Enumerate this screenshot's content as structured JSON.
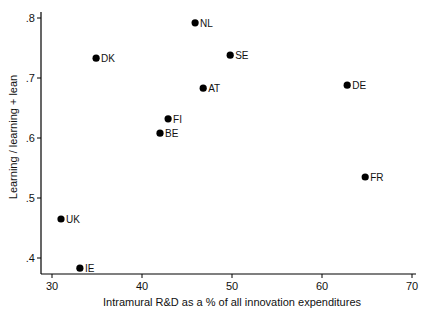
{
  "chart_data": {
    "type": "scatter",
    "title": "",
    "xlabel": "Intramural R&D as a % of all innovation expenditures",
    "ylabel": "Learning / learning + lean",
    "xlim": [
      29.5,
      71
    ],
    "ylim": [
      0.373,
      0.81
    ],
    "xticks": [
      30,
      40,
      50,
      60,
      70
    ],
    "xtick_labels": [
      "30",
      "40",
      "50",
      "60",
      "70"
    ],
    "yticks": [
      0.4,
      0.5,
      0.6,
      0.7,
      0.8
    ],
    "ytick_labels": [
      ".4",
      ".5",
      ".6",
      ".7",
      ".8"
    ],
    "grid": false,
    "legend": null,
    "points": [
      {
        "label": "NL",
        "x": 45.9,
        "y": 0.792
      },
      {
        "label": "DK",
        "x": 34.9,
        "y": 0.733
      },
      {
        "label": "SE",
        "x": 49.8,
        "y": 0.738
      },
      {
        "label": "AT",
        "x": 46.8,
        "y": 0.683
      },
      {
        "label": "DE",
        "x": 62.8,
        "y": 0.688
      },
      {
        "label": "FI",
        "x": 42.9,
        "y": 0.632
      },
      {
        "label": "BE",
        "x": 42.0,
        "y": 0.608
      },
      {
        "label": "FR",
        "x": 64.8,
        "y": 0.535
      },
      {
        "label": "UK",
        "x": 31.0,
        "y": 0.465
      },
      {
        "label": "IE",
        "x": 33.1,
        "y": 0.383
      }
    ]
  },
  "colors": {
    "marker": "#000000",
    "axis": "#000000",
    "text": "#111111"
  }
}
